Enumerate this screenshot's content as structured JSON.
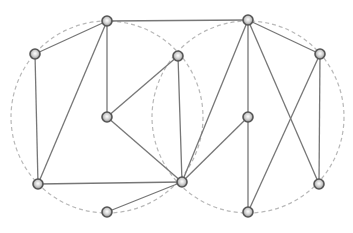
{
  "diagram": {
    "width": 353,
    "height": 233,
    "background": "#ffffff",
    "colors": {
      "edge": "#777777",
      "circle": "#b8b8b8",
      "node_fill": "#dddddd",
      "node_stroke": "#555555"
    },
    "circles": [
      {
        "id": "left-circle",
        "cx": 107,
        "cy": 117,
        "r": 96
      },
      {
        "id": "right-circle",
        "cx": 248,
        "cy": 117,
        "r": 96
      }
    ],
    "nodes": [
      {
        "id": "n1",
        "x": 107,
        "y": 21
      },
      {
        "id": "n2",
        "x": 248,
        "y": 20
      },
      {
        "id": "n3",
        "x": 35,
        "y": 54
      },
      {
        "id": "n4",
        "x": 178,
        "y": 56
      },
      {
        "id": "n5",
        "x": 320,
        "y": 54
      },
      {
        "id": "n6",
        "x": 107,
        "y": 117
      },
      {
        "id": "n7",
        "x": 248,
        "y": 117
      },
      {
        "id": "n8",
        "x": 38,
        "y": 184
      },
      {
        "id": "n9",
        "x": 182,
        "y": 182
      },
      {
        "id": "n10",
        "x": 319,
        "y": 184
      },
      {
        "id": "n11",
        "x": 107,
        "y": 212
      },
      {
        "id": "n12",
        "x": 248,
        "y": 212
      }
    ],
    "edges": [
      [
        "n1",
        "n3"
      ],
      [
        "n1",
        "n2"
      ],
      [
        "n1",
        "n6"
      ],
      [
        "n1",
        "n8"
      ],
      [
        "n3",
        "n8"
      ],
      [
        "n6",
        "n4"
      ],
      [
        "n6",
        "n9"
      ],
      [
        "n4",
        "n9"
      ],
      [
        "n2",
        "n5"
      ],
      [
        "n2",
        "n7"
      ],
      [
        "n2",
        "n9"
      ],
      [
        "n2",
        "n10"
      ],
      [
        "n5",
        "n10"
      ],
      [
        "n5",
        "n12"
      ],
      [
        "n7",
        "n9"
      ],
      [
        "n7",
        "n12"
      ],
      [
        "n8",
        "n9"
      ],
      [
        "n9",
        "n11"
      ]
    ]
  }
}
